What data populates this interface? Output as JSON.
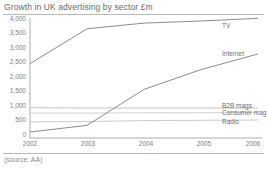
{
  "chart_title": "Growth in UK advertising by sector £m",
  "source_note": "(source: AA)",
  "chart_data": {
    "type": "line",
    "title": "Growth in UK advertising by sector £m",
    "xlabel": "",
    "ylabel": "£m",
    "categories": [
      "2002",
      "2003",
      "2004",
      "2005",
      "2006"
    ],
    "x": [
      2002,
      2003,
      2004,
      2005,
      2006
    ],
    "ylim": [
      0,
      4000
    ],
    "yticks": [
      0,
      500,
      1000,
      1500,
      2000,
      2500,
      3000,
      3500,
      4000
    ],
    "ytick_labels": [
      "0",
      "500",
      "1,000",
      "1,500",
      "2,000",
      "2,500",
      "3,000",
      "3,500",
      "4,000"
    ],
    "grid": false,
    "legend_position": "right-inline",
    "series": [
      {
        "name": "TV",
        "color": "#8c8c8c",
        "values": [
          2480,
          3640,
          3830,
          3900,
          3990
        ],
        "label_x": 2006,
        "label_y": 3990
      },
      {
        "name": "Internet",
        "color": "#8c8c8c",
        "values": [
          200,
          420,
          1620,
          2280,
          2800
        ],
        "label_x": 2006,
        "label_y": 2800
      },
      {
        "name": "B2B mags",
        "color": "#bdbdbd",
        "values": [
          1010,
          1000,
          1000,
          1000,
          1000
        ],
        "label_x": 2006,
        "label_y": 1000
      },
      {
        "name": "Consumer mags",
        "color": "#cccccc",
        "values": [
          830,
          830,
          840,
          840,
          850
        ],
        "label_x": 2006,
        "label_y": 850
      },
      {
        "name": "Radio",
        "color": "#c4c4c4",
        "values": [
          540,
          550,
          580,
          590,
          600
        ],
        "label_x": 2006,
        "label_y": 600
      }
    ]
  },
  "yticks": [
    {
      "label": "4,000"
    },
    {
      "label": "3,500"
    },
    {
      "label": "3,000"
    },
    {
      "label": "2,500"
    },
    {
      "label": "2,000"
    },
    {
      "label": "1,500"
    },
    {
      "label": "1,000"
    },
    {
      "label": "500"
    },
    {
      "label": "0"
    }
  ],
  "xticks": [
    {
      "label": "2002"
    },
    {
      "label": "2003"
    },
    {
      "label": "2004"
    },
    {
      "label": "2005"
    },
    {
      "label": "2006"
    }
  ],
  "series_labels": [
    {
      "label": "TV"
    },
    {
      "label": "Internet"
    },
    {
      "label": "B2B mags"
    },
    {
      "label": "Consumer mags"
    },
    {
      "label": "Radio"
    }
  ]
}
